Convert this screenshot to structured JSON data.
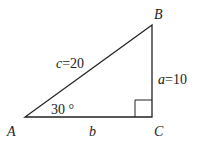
{
  "diagram": {
    "vertices": {
      "A": "A",
      "B": "B",
      "C": "C"
    },
    "sides": {
      "c": "c=20",
      "a": "a=10",
      "b": "b"
    },
    "angle_A": "30 °",
    "right_angle_at": "C"
  }
}
